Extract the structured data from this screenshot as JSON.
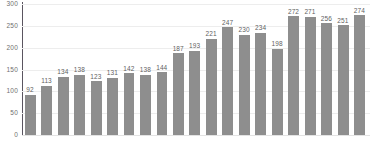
{
  "chart_data": {
    "type": "bar",
    "title": "",
    "subtitle": "",
    "xlabel": "",
    "ylabel": "",
    "ylim": [
      0,
      300
    ],
    "grid": true,
    "legend": false,
    "legend_position": "none",
    "bar_color": "#8e8e8e",
    "gridline_color": "#ededed",
    "axis_color": "#5a5560",
    "value_label_color": "#5f5f5f",
    "tick_label_color": "#6f6f6f",
    "y_ticks": [
      0,
      50,
      100,
      150,
      200,
      250,
      300
    ],
    "y_tick_labels": [
      "0",
      "50",
      "100",
      "150",
      "200",
      "250",
      "300"
    ],
    "categories": [
      "1",
      "2",
      "3",
      "4",
      "5",
      "6",
      "7",
      "8",
      "9",
      "10",
      "11",
      "12",
      "13",
      "14",
      "15",
      "16",
      "17",
      "18",
      "19",
      "20",
      "21"
    ],
    "values": [
      92,
      113,
      134,
      138,
      123,
      131,
      142,
      138,
      144,
      187,
      193,
      221,
      247,
      230,
      234,
      198,
      272,
      271,
      256,
      251,
      274
    ],
    "value_labels": [
      "92",
      "113",
      "134",
      "138",
      "123",
      "131",
      "142",
      "138",
      "144",
      "187",
      "193",
      "221",
      "247",
      "230",
      "234",
      "198",
      "272",
      "271",
      "256",
      "251",
      "274"
    ],
    "x_tick_labels": [
      "",
      "",
      "",
      "",
      "",
      "",
      "",
      "",
      "",
      "",
      "",
      "",
      "",
      "",
      "",
      "",
      "",
      "",
      "",
      "",
      ""
    ]
  }
}
